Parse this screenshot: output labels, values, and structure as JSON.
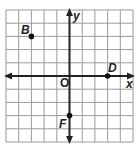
{
  "diagram": {
    "type": "coordinate-plane",
    "grid": {
      "cols": 10,
      "rows": 10,
      "x_range": [
        -5,
        5
      ],
      "y_range": [
        -5,
        5
      ],
      "line_color": "#9a9a9a",
      "axis_color": "#222222"
    },
    "axes": {
      "x_label": "x",
      "y_label": "y",
      "origin_label": "O"
    },
    "points": [
      {
        "name": "B",
        "x": -3,
        "y": 3
      },
      {
        "name": "D",
        "x": 3,
        "y": 0
      },
      {
        "name": "F",
        "x": 0,
        "y": -3
      }
    ]
  }
}
